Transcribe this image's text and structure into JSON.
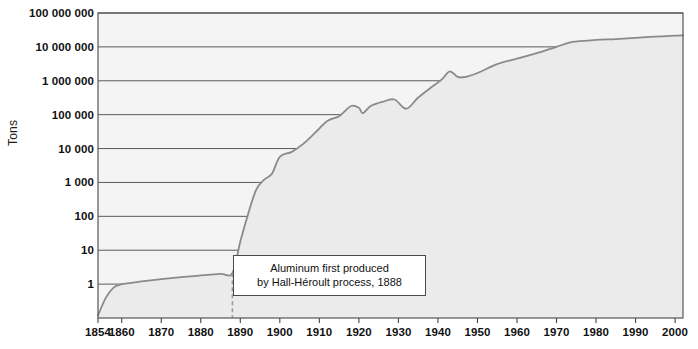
{
  "chart_data": {
    "type": "area",
    "title": "",
    "xlabel": "",
    "ylabel": "Tons",
    "yscale": "log",
    "ylim": [
      0.1,
      100000000
    ],
    "xlim": [
      1854,
      2002
    ],
    "grid": true,
    "legend": false,
    "y_tick_labels": [
      "100 000 000",
      "10 000 000",
      "1 000 000",
      "100 000",
      "10 000",
      "1 000",
      "100",
      "10",
      "1"
    ],
    "y_tick_values": [
      100000000,
      10000000,
      1000000,
      100000,
      10000,
      1000,
      100,
      10,
      1
    ],
    "x_tick_labels": [
      "1854",
      "1860",
      "1870",
      "1880",
      "1890",
      "1900",
      "1910",
      "1920",
      "1930",
      "1940",
      "1950",
      "1960",
      "1970",
      "1980",
      "1990",
      "2000"
    ],
    "x_tick_values": [
      1854,
      1860,
      1870,
      1880,
      1890,
      1900,
      1910,
      1920,
      1930,
      1940,
      1950,
      1960,
      1970,
      1980,
      1990,
      2000
    ],
    "series": [
      {
        "name": "World aluminum production",
        "x": [
          1854,
          1856,
          1858,
          1860,
          1865,
          1870,
          1875,
          1880,
          1885,
          1888,
          1890,
          1892,
          1894,
          1896,
          1898,
          1900,
          1903,
          1906,
          1909,
          1912,
          1915,
          1918,
          1920,
          1921,
          1923,
          1926,
          1929,
          1932,
          1935,
          1938,
          1941,
          1943,
          1945,
          1947,
          1950,
          1955,
          1960,
          1965,
          1970,
          1974,
          1980,
          1985,
          1990,
          1995,
          2000,
          2002
        ],
        "y": [
          0.12,
          0.4,
          0.8,
          1.0,
          1.2,
          1.4,
          1.6,
          1.8,
          2.0,
          2.1,
          18,
          120,
          600,
          1200,
          1800,
          5700,
          8000,
          14000,
          30000,
          65000,
          90000,
          180000,
          160000,
          110000,
          180000,
          240000,
          280000,
          150000,
          320000,
          600000,
          1100000,
          1900000,
          1300000,
          1300000,
          1700000,
          3100000,
          4500000,
          6500000,
          10000000,
          14000000,
          16000000,
          17000000,
          18500000,
          20000000,
          21500000,
          22000000
        ],
        "color": "#8a8a8a",
        "fill_color": "#ebebeb"
      }
    ],
    "annotations": [
      {
        "name": "hall-heroult-note",
        "line1": "Aluminum first produced",
        "line2": "by Hall-Héroult process, 1888",
        "marker_year": 1888,
        "marker_style": "dashed-vertical"
      }
    ]
  }
}
